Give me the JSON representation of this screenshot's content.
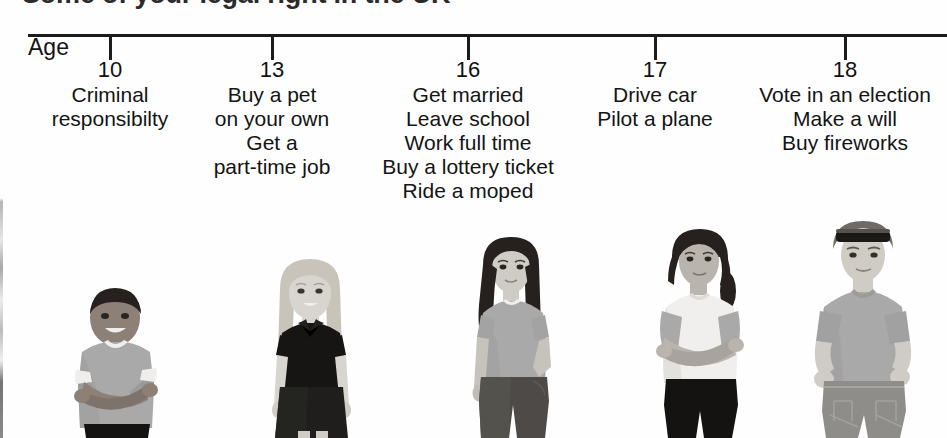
{
  "title": "Some of your legal right in the UK",
  "axis": {
    "label": "Age"
  },
  "columns": [
    {
      "age": "10",
      "tick_x": 110,
      "rights": [
        "Criminal",
        "responsibilty"
      ],
      "figure": "boy-arms-crossed"
    },
    {
      "age": "13",
      "tick_x": 272,
      "rights": [
        "Buy a pet",
        "on your own",
        "Get a",
        "part-time job"
      ],
      "figure": "blonde-girl-black-polo"
    },
    {
      "age": "16",
      "tick_x": 468,
      "rights": [
        "Get married",
        "Leave school",
        "Work full time",
        "Buy a lottery ticket",
        "Ride a moped"
      ],
      "figure": "long-dark-hair-teen-girl"
    },
    {
      "age": "17",
      "tick_x": 655,
      "rights": [
        "Drive car",
        "Pilot a plane"
      ],
      "figure": "teen-arms-crossed-white-top"
    },
    {
      "age": "18",
      "tick_x": 845,
      "rights": [
        "Vote in an election",
        "Make a will",
        "Buy fireworks"
      ],
      "figure": "young-man-sunglasses-on-head"
    }
  ],
  "colors": {
    "ink": "#1a1a1a",
    "axis": "#1c1c1c",
    "background": "#fefefe",
    "skin_light": "#d8d5d0",
    "skin_mid": "#b9b4ae",
    "skin_dark": "#8c8077",
    "hair_dark": "#26211e",
    "hair_blonde": "#c9c4ba",
    "shirt_gray": "#a9a9a9",
    "shirt_white": "#f0efed",
    "shirt_black": "#161514",
    "pants_black": "#141312",
    "pants_gray": "#8f8d8a"
  }
}
